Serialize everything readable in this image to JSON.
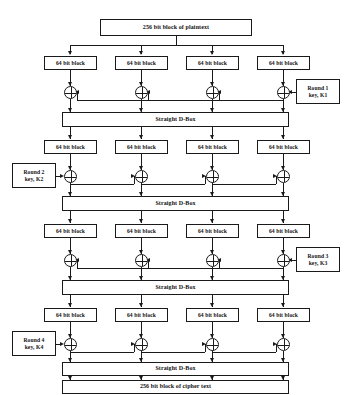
{
  "diagram": {
    "stroke_color": "#1a1a1a",
    "background_color": "#ffffff",
    "plaintext_label": "256 bit block of plaintext",
    "ciphertext_label": "256 bit block of cipher text",
    "dbox_label": "Straight D-Box",
    "block_label": "64 bit block",
    "xor_symbol": "XOR",
    "blocks_per_row": 4,
    "rounds": [
      {
        "number": 1,
        "key_label": "Round 1\nkey, K1",
        "key_side": "right",
        "flow": "right-to-left"
      },
      {
        "number": 2,
        "key_label": "Round 2\nkey, K2",
        "key_side": "left",
        "flow": "left-to-right"
      },
      {
        "number": 3,
        "key_label": "Round 3\nkey, K3",
        "key_side": "right",
        "flow": "right-to-left"
      },
      {
        "number": 4,
        "key_label": "Round 4\nkey, K4",
        "key_side": "left",
        "flow": "left-to-right"
      }
    ],
    "rows": [
      {
        "id": "row1",
        "blocks": [
          "64 bit block",
          "64 bit block",
          "64 bit block",
          "64 bit block"
        ]
      },
      {
        "id": "row2",
        "blocks": [
          "64 bit block",
          "64 bit block",
          "64 bit block",
          "64 bit block"
        ]
      },
      {
        "id": "row3",
        "blocks": [
          "64 bit block",
          "64 bit block",
          "64 bit block",
          "64 bit block"
        ]
      },
      {
        "id": "row4",
        "blocks": [
          "64 bit block",
          "64 bit block",
          "64 bit block",
          "64 bit block"
        ]
      }
    ],
    "dboxes": [
      "Straight D-Box",
      "Straight D-Box",
      "Straight D-Box",
      "Straight D-Box"
    ]
  }
}
